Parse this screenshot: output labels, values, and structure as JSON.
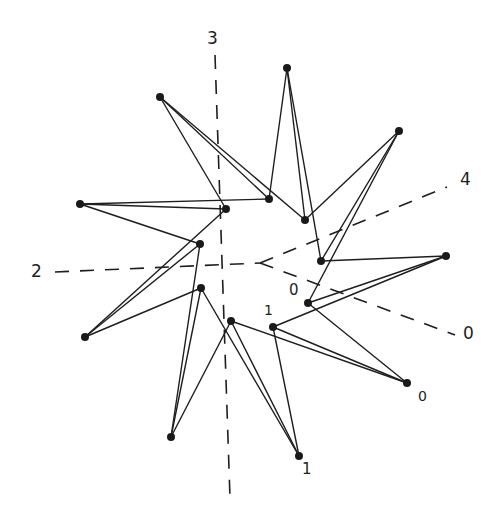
{
  "diagram": {
    "type": "star-polygon with dashed radial axes",
    "center": [
      260,
      263
    ],
    "colors": {
      "ink": "#1e1e1e",
      "background": "#ffffff"
    },
    "outer_nodes": [
      {
        "id": "P1",
        "x": 287,
        "y": 68
      },
      {
        "id": "P2",
        "x": 399,
        "y": 131
      },
      {
        "id": "P3",
        "x": 446,
        "y": 256
      },
      {
        "id": "P4",
        "x": 407,
        "y": 383
      },
      {
        "id": "P5",
        "x": 299,
        "y": 456
      },
      {
        "id": "P6",
        "x": 171,
        "y": 437
      },
      {
        "id": "P7",
        "x": 85,
        "y": 337
      },
      {
        "id": "P8",
        "x": 80,
        "y": 204
      },
      {
        "id": "P9",
        "x": 160,
        "y": 97
      }
    ],
    "inner_nodes": [
      {
        "id": "I1",
        "x": 269,
        "y": 199
      },
      {
        "id": "I2",
        "x": 305,
        "y": 220
      },
      {
        "id": "I3",
        "x": 321,
        "y": 261
      },
      {
        "id": "I4",
        "x": 308,
        "y": 303
      },
      {
        "id": "I5",
        "x": 273,
        "y": 327
      },
      {
        "id": "I6",
        "x": 231,
        "y": 321
      },
      {
        "id": "I7",
        "x": 201,
        "y": 288
      },
      {
        "id": "I8",
        "x": 200,
        "y": 244
      },
      {
        "id": "I9",
        "x": 226,
        "y": 209
      }
    ],
    "edges": [
      [
        "P9",
        "I1"
      ],
      [
        "P9",
        "I2"
      ],
      [
        "P9",
        "I9"
      ],
      [
        "P1",
        "I1"
      ],
      [
        "P1",
        "I2"
      ],
      [
        "P1",
        "I3"
      ],
      [
        "P2",
        "I2"
      ],
      [
        "P2",
        "I3"
      ],
      [
        "P2",
        "I4"
      ],
      [
        "P3",
        "I3"
      ],
      [
        "P3",
        "I4"
      ],
      [
        "P3",
        "I5"
      ],
      [
        "P4",
        "I4"
      ],
      [
        "P4",
        "I5"
      ],
      [
        "P4",
        "I6"
      ],
      [
        "P5",
        "I5"
      ],
      [
        "P5",
        "I6"
      ],
      [
        "P5",
        "I7"
      ],
      [
        "P6",
        "I6"
      ],
      [
        "P6",
        "I7"
      ],
      [
        "P6",
        "I8"
      ],
      [
        "P7",
        "I7"
      ],
      [
        "P7",
        "I8"
      ],
      [
        "P7",
        "I9"
      ],
      [
        "P8",
        "I8"
      ],
      [
        "P8",
        "I9"
      ],
      [
        "P8",
        "I1"
      ]
    ],
    "axes": [
      {
        "label": "2",
        "from": [
          55,
          272
        ],
        "to": [
          260,
          263
        ]
      },
      {
        "label": "3",
        "from": [
          215,
          55
        ],
        "to": [
          230,
          498
        ]
      },
      {
        "label": "4",
        "from": [
          260,
          263
        ],
        "to": [
          447,
          187
        ]
      },
      {
        "label": "0",
        "from": [
          260,
          263
        ],
        "to": [
          455,
          335
        ]
      }
    ],
    "labels": {
      "axis_2": "2",
      "axis_3": "3",
      "axis_4": "4",
      "axis_0": "0",
      "node_0_inner": "0",
      "node_1_inner": "1",
      "node_0_outer": "0",
      "node_1_outer": "1"
    }
  }
}
